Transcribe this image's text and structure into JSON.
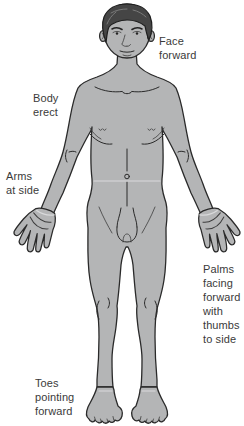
{
  "illustration": {
    "labels": {
      "face_forward": "Face\nforward",
      "body_erect": "Body\nerect",
      "arms_at_side": "Arms\nat side",
      "palms_facing": "Palms\nfacing\nforward\nwith\nthumbs\nto side",
      "toes_pointing": "Toes\npointing\nforward"
    }
  },
  "colors": {
    "background": "#ffffff",
    "body_fill": "#b4b5b6",
    "outline": "#2a2a2a",
    "hair_fill": "#454545",
    "label_text": "#3a3a3a"
  }
}
